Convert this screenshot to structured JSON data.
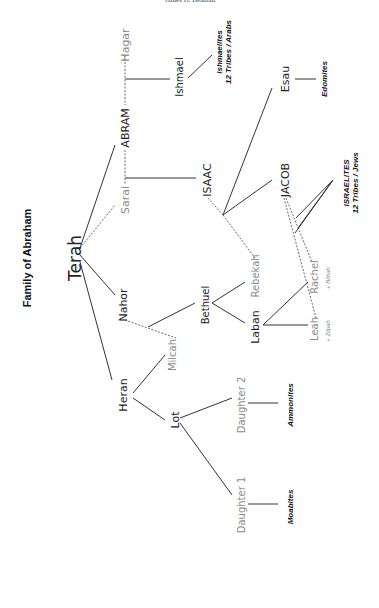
{
  "header": {
    "running_head": "James H. Beaman"
  },
  "diagram": {
    "title": "Family of Abraham",
    "people": {
      "terah": "Terah",
      "abram": "ABRAM",
      "hagar": "Hagar",
      "sarai": "Sarai",
      "nahor": "Nahor",
      "heran": "Heran",
      "milcah": "Milcah",
      "lot": "Lot",
      "ishmael": "Ishmael",
      "isaac": "ISAAC",
      "bethuel": "Bethuel",
      "rebekah": "Rebekah",
      "laban": "Laban",
      "daughter2": "Daughter 2",
      "daughter1": "Daughter 1",
      "esau": "Esau",
      "jacob": "JACOB",
      "rachel": "Rachel",
      "leah": "Leah"
    },
    "notes": {
      "bilhah": "+ Bilhah",
      "zilpah": "+ Zilpah"
    },
    "nations": {
      "ishmaelites_1": "Ishmaelites",
      "ishmaelites_2": "12 Tribes / Arabs",
      "edomites": "Edomites",
      "israelites_1": "ISRAELITES",
      "israelites_2": "12 Tribes / Jews",
      "ammonites": "Ammonites",
      "moabites": "Moabites"
    },
    "colors": {
      "primary_text": "#222222",
      "spouse_text": "#8a8a8a",
      "line": "#333333"
    }
  }
}
